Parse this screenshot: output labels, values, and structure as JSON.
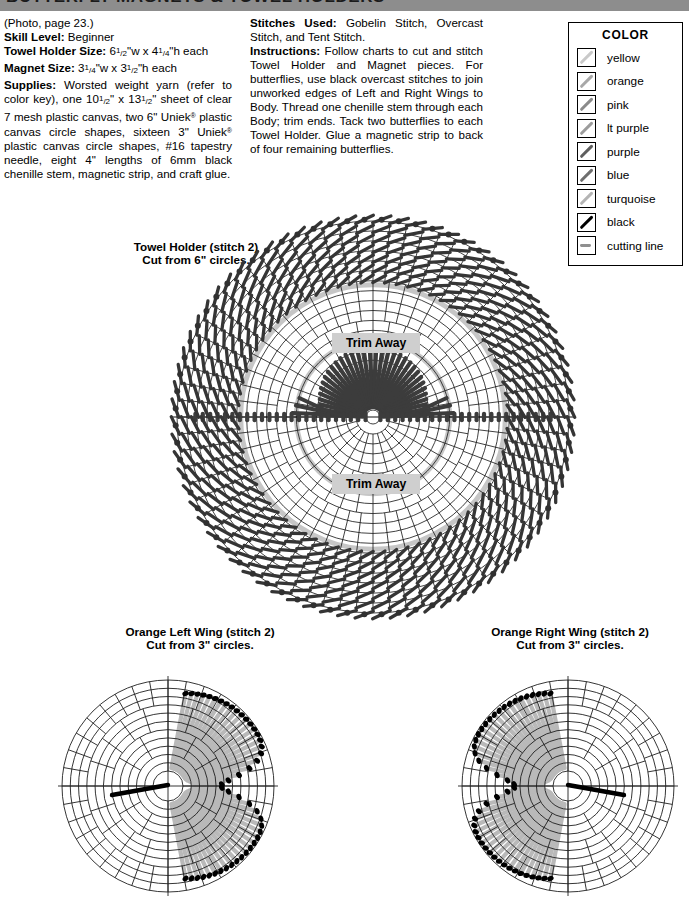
{
  "header": {
    "title": "BUTTERFLY MAGNETS & TOWEL HOLDERS"
  },
  "left_column": {
    "photo_note": "(Photo, page 23.)",
    "skill_level_label": "Skill Level:",
    "skill_level_value": "Beginner",
    "towel_holder_size_label": "Towel Holder Size:",
    "towel_holder_size_value": "6½\"w x 4¼\"h each",
    "magnet_size_label": "Magnet Size:",
    "magnet_size_value": "3¼\"w x 3½\"h each",
    "supplies_label": "Supplies:",
    "supplies_value": "Worsted weight yarn (refer to color key), one 10½\" x 13½\" sheet of clear 7 mesh plastic canvas, two 6\" Uniek® plastic canvas circle shapes, sixteen 3\" Uniek® plastic canvas circle shapes, #16 tapestry needle, eight 4\" lengths of 6mm black chenille stem, magnetic strip, and craft glue."
  },
  "right_column": {
    "stitches_used_label": "Stitches Used:",
    "stitches_used_value": "Gobelin Stitch, Overcast Stitch, and Tent Stitch.",
    "instructions_label": "Instructions:",
    "instructions_value": "Follow charts to cut and stitch Towel Holder and Magnet pieces. For butterflies, use black overcast stitches to join unworked edges of Left and Right Wings to Body. Thread one chenille stem through each Body; trim ends. Tack two butterflies to each Towel Holder. Glue a magnetic strip to back of four remaining butterflies."
  },
  "color_key": {
    "title": "COLOR",
    "items": [
      {
        "label": "yellow",
        "swatch": "slash",
        "color": "#c9c9c9"
      },
      {
        "label": "orange",
        "swatch": "slash",
        "color": "#a8a8a8"
      },
      {
        "label": "pink",
        "swatch": "slash",
        "color": "#8a8a8a"
      },
      {
        "label": "lt purple",
        "swatch": "slash",
        "color": "#9c9c9c"
      },
      {
        "label": "purple",
        "swatch": "slash",
        "color": "#5e5e5e"
      },
      {
        "label": "blue",
        "swatch": "slash",
        "color": "#6e6e6e"
      },
      {
        "label": "turquoise",
        "swatch": "slash",
        "color": "#b4b4b4"
      },
      {
        "label": "black",
        "swatch": "slash",
        "color": "#000000"
      },
      {
        "label": "cutting line",
        "swatch": "dash",
        "color": "#8f8f8f"
      }
    ]
  },
  "charts": {
    "towel_holder": {
      "caption_line1": "Towel Holder (stitch 2)",
      "caption_line2": "Cut from 6\" circles.",
      "trim_away_top": "Trim Away",
      "trim_away_bottom": "Trim Away"
    },
    "left_wing": {
      "caption_line1": "Orange Left Wing (stitch 2)",
      "caption_line2": "Cut from 3\" circles."
    },
    "right_wing": {
      "caption_line1": "Orange Right Wing (stitch 2)",
      "caption_line2": "Cut from 3\" circles."
    }
  },
  "chart_data": {
    "type": "diagram",
    "pieces": [
      {
        "name": "Towel Holder",
        "shape": "polar-circle-grid",
        "cut_from": "6 inch circles",
        "quantity": 2,
        "outer_radius_px": 196,
        "grid_rings": 18,
        "spokes": 72,
        "stitched_band_rings": [
          12,
          18
        ],
        "stitch_color": "#3a3a3a",
        "trim_regions": [
          "upper inner arc",
          "lower inner arc"
        ],
        "center_fan_rings": [
          1,
          6
        ]
      },
      {
        "name": "Orange Left Wing",
        "shape": "polar-circle-grid",
        "cut_from": "3 inch circles",
        "outer_radius_px": 106,
        "grid_rings": 11,
        "spokes": 36,
        "filled_sector_deg": [
          100,
          260
        ],
        "stitch_color": "#b3b3b3",
        "cut_edge_color": "#000000"
      },
      {
        "name": "Orange Right Wing",
        "shape": "polar-circle-grid",
        "cut_from": "3 inch circles",
        "outer_radius_px": 106,
        "grid_rings": 11,
        "spokes": 36,
        "filled_sector_deg": [
          -80,
          80
        ],
        "stitch_color": "#b3b3b3",
        "cut_edge_color": "#000000"
      }
    ]
  }
}
